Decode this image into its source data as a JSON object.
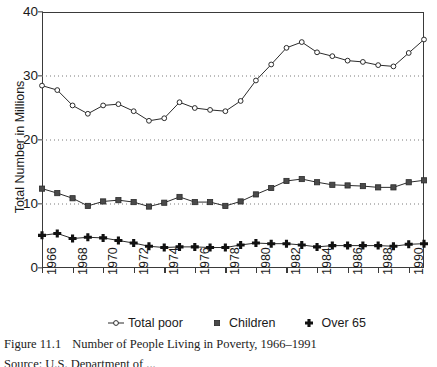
{
  "chart_data": {
    "type": "line",
    "title": "",
    "xlabel": "",
    "ylabel": "Total Number in Millions",
    "ylim": [
      0,
      40
    ],
    "yticks": [
      0,
      10,
      20,
      30,
      40
    ],
    "gridlines": [
      10,
      20,
      30
    ],
    "grid": "horizontal-dotted",
    "xlim": [
      1966,
      1991
    ],
    "xticks": [
      1966,
      1968,
      1970,
      1972,
      1974,
      1976,
      1978,
      1980,
      1982,
      1984,
      1986,
      1988,
      1990
    ],
    "xtick_labels": [
      "1966",
      "1968",
      "1970",
      "1972",
      "1974",
      "1976",
      "1978",
      "1980",
      "1982",
      "1984",
      "1986",
      "1988",
      "1990"
    ],
    "x": [
      1966,
      1967,
      1968,
      1969,
      1970,
      1971,
      1972,
      1973,
      1974,
      1975,
      1976,
      1977,
      1978,
      1979,
      1980,
      1981,
      1982,
      1983,
      1984,
      1985,
      1986,
      1987,
      1988,
      1989,
      1990,
      1991
    ],
    "legend_position": "below-axes",
    "series": [
      {
        "name": "Total poor",
        "marker": "open-circle",
        "values": [
          28.5,
          27.8,
          25.4,
          24.1,
          25.4,
          25.6,
          24.5,
          23.0,
          23.4,
          25.9,
          25.0,
          24.7,
          24.5,
          26.1,
          29.3,
          31.8,
          34.4,
          35.3,
          33.7,
          33.1,
          32.4,
          32.2,
          31.7,
          31.5,
          33.6,
          35.7
        ]
      },
      {
        "name": "Children",
        "marker": "filled-square",
        "values": [
          12.4,
          11.7,
          10.9,
          9.7,
          10.4,
          10.6,
          10.3,
          9.6,
          10.2,
          11.1,
          10.3,
          10.3,
          9.7,
          10.4,
          11.5,
          12.5,
          13.6,
          13.9,
          13.4,
          13.0,
          12.9,
          12.8,
          12.6,
          12.6,
          13.4,
          13.7
        ]
      },
      {
        "name": "Over 65",
        "marker": "filled-plus",
        "values": [
          5.1,
          5.4,
          4.6,
          4.8,
          4.7,
          4.3,
          3.9,
          3.4,
          3.2,
          3.3,
          3.3,
          3.2,
          3.2,
          3.6,
          3.9,
          3.8,
          3.8,
          3.6,
          3.3,
          3.5,
          3.5,
          3.5,
          3.5,
          3.4,
          3.7,
          3.8
        ]
      }
    ]
  },
  "axis": {
    "y_title": "Total Number in Millions"
  },
  "legend": {
    "items": [
      {
        "label": "Total poor",
        "glyph": "line-open-circle-marker"
      },
      {
        "label": "Children",
        "glyph": "filled-square-marker"
      },
      {
        "label": "Over 65",
        "glyph": "filled-plus-marker"
      }
    ]
  },
  "caption": {
    "figure_number": "Figure 11.1",
    "text": "Number of People Living in Poverty, 1966–1991",
    "source_partial": "Source:  U.S. Department of ..."
  },
  "colors": {
    "axis": "#3a3a3a",
    "line": "#2b2b2b",
    "grid": "#7a7a7a",
    "text": "#1a1a1a"
  }
}
